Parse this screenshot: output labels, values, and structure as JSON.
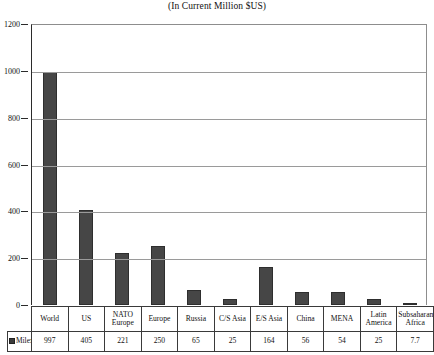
{
  "chart_data": {
    "type": "bar",
    "title": "(In Current Million $US)",
    "xlabel": "",
    "ylabel": "",
    "ylim": [
      0,
      1200
    ],
    "yticks": [
      0,
      200,
      400,
      600,
      800,
      1000,
      1200
    ],
    "grid": true,
    "legend_position": "bottom-left-table",
    "series_name": "Milex",
    "bar_color": "#464646",
    "categories": [
      "World",
      "US",
      "NATO Europe",
      "Europe",
      "Russia",
      "C/S Asia",
      "E/S  Asia",
      "China",
      "MENA",
      "Latin America",
      "Subsaharan Africa"
    ],
    "values": [
      997,
      405,
      221,
      250,
      65,
      25,
      164,
      56,
      54,
      25,
      7.7
    ],
    "value_labels": [
      "997",
      "405",
      "221",
      "250",
      "65",
      "25",
      "164",
      "56",
      "54",
      "25",
      "7.7"
    ],
    "category_lines": [
      [
        "World"
      ],
      [
        "US"
      ],
      [
        "NATO",
        "Europe"
      ],
      [
        "Europe"
      ],
      [
        "Russia"
      ],
      [
        "C/S Asia"
      ],
      [
        "E/S  Asia"
      ],
      [
        "China"
      ],
      [
        "MENA"
      ],
      [
        "Latin",
        "America"
      ],
      [
        "Subsaharan",
        "Africa"
      ]
    ]
  },
  "table": {
    "legend_label": "Milex"
  }
}
